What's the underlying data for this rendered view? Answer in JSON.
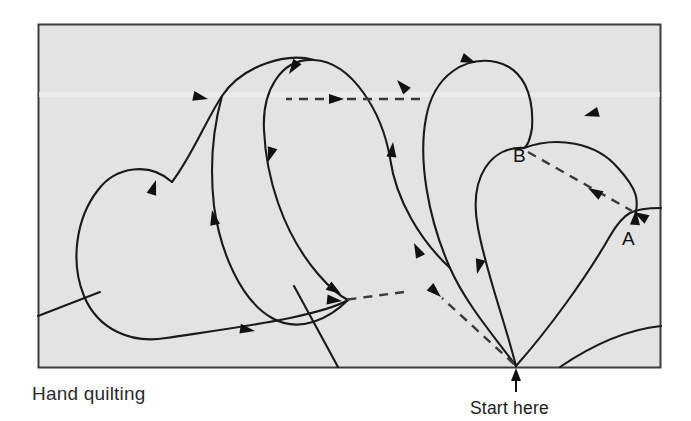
{
  "figure": {
    "caption": "Hand quilting",
    "start_label": "Start here",
    "point_labels": [
      {
        "id": "B",
        "text": "B",
        "x": 522,
        "y": 155
      },
      {
        "id": "A",
        "text": "A",
        "x": 628,
        "y": 239
      }
    ],
    "frame": {
      "x": 38,
      "y": 24,
      "width": 623,
      "height": 344,
      "background_color": "#e3e3e3",
      "border_color": "#3c3c3c"
    },
    "colors": {
      "stroke": "#1a1a1a",
      "dashed_stroke": "#3a3a3a",
      "page_background": "#ffffff",
      "text": "#2b2b2b"
    },
    "start_point": {
      "x": 516,
      "y": 366
    },
    "stitch_path_description": "Looping petal stitch path with directional arrowheads",
    "travel_lines_label": "dashed travel lines",
    "solid_paths": [
      "M 516 366 C 470 320 430 250 424 180 C 418 110 452 60 492 60 C 530 60 556 92 556 130",
      "M 424 180 C 420 120 390 66 340 62 C 290 58 262 104 266 156",
      "M 340 62 C 300 52 246 76 228 110 C 210 144 196 176 176 196",
      "M 228 110 C 190 108 148 150 140 196 C 130 250 150 300 186 322",
      "M 266 156 C 272 220 300 282 340 306",
      "M 176 196 C 166 250 188 300 232 320"
    ],
    "dashed_paths": [
      "M 284 99 L 420 99",
      "M 528 152 L 634 212",
      "M 516 366 L 440 298",
      "M 400 292 L 340 300"
    ],
    "arrowheads": [
      {
        "name": "petal-1-top-left",
        "x": 208,
        "y": 99,
        "angle": 195
      },
      {
        "name": "petal-1-descend",
        "x": 155,
        "y": 178,
        "angle": 100
      },
      {
        "name": "petal-1-lower-right",
        "x": 210,
        "y": 236,
        "angle": 40
      },
      {
        "name": "petal-1-bottom",
        "x": 255,
        "y": 330,
        "angle": 188
      },
      {
        "name": "petal-2-top-left",
        "x": 288,
        "y": 73,
        "angle": 325
      },
      {
        "name": "petal-2-left-mid",
        "x": 270,
        "y": 163,
        "angle": 290
      },
      {
        "name": "petal-2-lower-right",
        "x": 340,
        "y": 273,
        "angle": 215
      },
      {
        "name": "petal-3-top-right",
        "x": 396,
        "y": 80,
        "angle": 40
      },
      {
        "name": "petal-3-right-mid",
        "x": 392,
        "y": 140,
        "angle": 95
      },
      {
        "name": "petal-3-lower",
        "x": 411,
        "y": 243,
        "angle": 62
      },
      {
        "name": "petal-4-apex",
        "x": 479,
        "y": 63,
        "angle": 200
      },
      {
        "name": "petal-4-ascend",
        "x": 478,
        "y": 273,
        "angle": 286
      },
      {
        "name": "petal-5-apex",
        "x": 584,
        "y": 116,
        "angle": 352
      },
      {
        "name": "petal-5-descend-to-A",
        "x": 636,
        "y": 208,
        "angle": 100
      },
      {
        "name": "dashed-top-horizontal",
        "x": 346,
        "y": 99,
        "angle": 180
      },
      {
        "name": "dashed-B-to-A",
        "x": 586,
        "y": 186,
        "angle": 30
      },
      {
        "name": "dashed-to-A-end",
        "x": 634,
        "y": 212,
        "angle": 30
      },
      {
        "name": "dashed-lower-left",
        "x": 341,
        "y": 301,
        "angle": 187
      },
      {
        "name": "dashed-lower-mid",
        "x": 441,
        "y": 297,
        "angle": 222
      },
      {
        "name": "start-here-arrow",
        "x": 516,
        "y": 370,
        "angle": 270
      }
    ]
  }
}
